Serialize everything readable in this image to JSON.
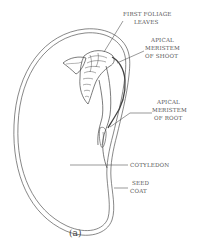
{
  "diagram": {
    "type": "labeled botanical illustration",
    "caption": "(a)",
    "labels": [
      {
        "id": "first-foliage-leaves",
        "lines": [
          "FIRST FOLIAGE",
          "LEAVES"
        ]
      },
      {
        "id": "apical-meristem-shoot",
        "lines": [
          "APICAL",
          "MERISTEM",
          "OF SHOOT"
        ]
      },
      {
        "id": "apical-meristem-root",
        "lines": [
          "APICAL",
          "MERISTEM",
          "OF ROOT"
        ]
      },
      {
        "id": "cotyledon",
        "lines": [
          "COTYLEDON"
        ]
      },
      {
        "id": "seed-coat",
        "lines": [
          "SEED",
          "COAT"
        ]
      }
    ],
    "colors": {
      "line": "#444444",
      "text": "#555555",
      "background": "#ffffff"
    }
  }
}
